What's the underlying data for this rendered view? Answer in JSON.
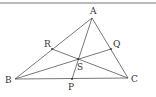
{
  "diagram": {
    "type": "triangle-cevians",
    "points": {
      "A": {
        "label": "A",
        "x": 92,
        "y": 18,
        "lx": 90,
        "ly": 14
      },
      "B": {
        "label": "B",
        "x": 15,
        "y": 79,
        "lx": 5,
        "ly": 83
      },
      "C": {
        "label": "C",
        "x": 128,
        "y": 78,
        "lx": 131,
        "ly": 82
      },
      "P": {
        "label": "P",
        "x": 72,
        "y": 79,
        "lx": 68,
        "ly": 90
      },
      "Q": {
        "label": "Q",
        "x": 111,
        "y": 49,
        "lx": 113,
        "ly": 47
      },
      "R": {
        "label": "R",
        "x": 52,
        "y": 49,
        "lx": 44,
        "ly": 47
      },
      "S": {
        "label": "S",
        "x": 78,
        "y": 59,
        "lx": 77,
        "ly": 70
      }
    },
    "segments": [
      [
        "A",
        "B"
      ],
      [
        "B",
        "C"
      ],
      [
        "C",
        "A"
      ],
      [
        "A",
        "P"
      ],
      [
        "B",
        "Q"
      ],
      [
        "C",
        "R"
      ]
    ],
    "colors": {
      "line": "#555555",
      "border": "#666666"
    }
  }
}
